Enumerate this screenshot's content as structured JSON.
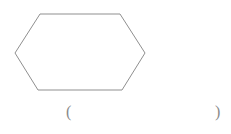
{
  "page": {
    "background_color": "#ffffff",
    "width": 231,
    "height": 134
  },
  "figure": {
    "name": "hexagon",
    "shape_type": "hexagon",
    "stroke_color": "#8f8f8f",
    "stroke_width": 1,
    "fill": "none",
    "vertices": [
      {
        "label": "left",
        "x": 15,
        "y": 53
      },
      {
        "label": "top-left",
        "x": 40,
        "y": 14
      },
      {
        "label": "top-right",
        "x": 120,
        "y": 14
      },
      {
        "label": "right",
        "x": 145,
        "y": 53
      },
      {
        "label": "bottom-right",
        "x": 122,
        "y": 90
      },
      {
        "label": "bottom-left",
        "x": 38,
        "y": 90
      }
    ],
    "points_attr": "15,53 40,14 120,14 145,53 122,90 38,90"
  },
  "answer": {
    "open_paren": "(",
    "close_paren": ")",
    "value": "",
    "text_color": "#8a8a8a"
  }
}
